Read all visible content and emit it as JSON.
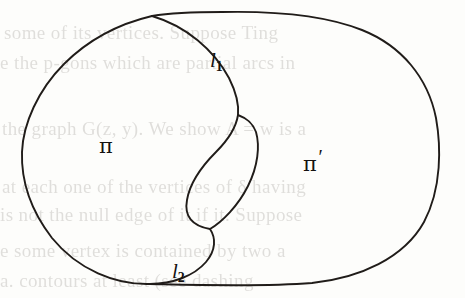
{
  "figure": {
    "name": "jordan-curve-two-regions",
    "background_color": "#fdfdfb",
    "ink_color": "#141210",
    "width": 465,
    "height": 298,
    "labels": {
      "arc_upper": "l",
      "arc_upper_sub": "1",
      "arc_lower": "l",
      "arc_lower_sub": "2",
      "region_left": "π",
      "region_right": "π",
      "region_right_prime": "′"
    }
  },
  "bleed_through": {
    "note": "faint show-through text from the reverse side of the scanned page",
    "lines": [
      "some of its vertices. Suppose Ting",
      "e the p-gons which are partial arcs in",
      "the graph G(z, y). We show A = w is a",
      "at each one of the vertices of δ having",
      "is not the null edge of it if it. Suppose",
      "e some vertex is contained by two a",
      "a. contours at least (see dashing"
    ]
  }
}
